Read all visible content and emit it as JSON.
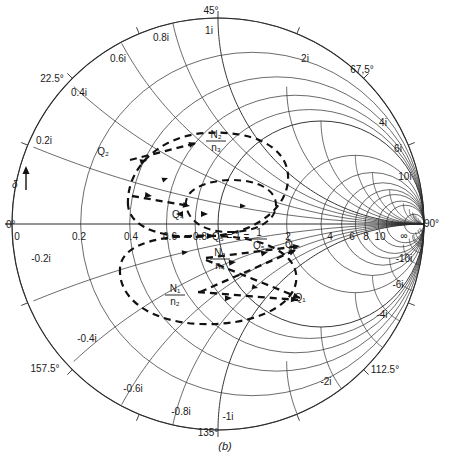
{
  "figure": {
    "caption": "(b)",
    "type": "smith-chart",
    "delta_marker": "δ"
  },
  "chart_data": {
    "type": "smith-chart",
    "title": "",
    "subtitle": "",
    "xlabel": "",
    "ylabel": "",
    "grid": true,
    "legend_position": "none",
    "center": [
      218,
      224
    ],
    "radius": 206,
    "angle_labels": [
      {
        "text": "0°",
        "deg": 0,
        "x": 6,
        "y": 228
      },
      {
        "text": "22.5°",
        "deg": 22.5,
        "x": 52,
        "y": 82
      },
      {
        "text": "45°",
        "deg": 45,
        "x": 211,
        "y": 14
      },
      {
        "text": "67,5°",
        "deg": 67.5,
        "x": 362,
        "y": 73
      },
      {
        "text": "90°",
        "deg": 90,
        "x": 424,
        "y": 227
      },
      {
        "text": "112.5°",
        "deg": 112.5,
        "x": 385,
        "y": 373
      },
      {
        "text": "135°",
        "deg": 135,
        "x": 208,
        "y": 436
      },
      {
        "text": "157.5°",
        "deg": 157.5,
        "x": 45,
        "y": 372
      }
    ],
    "resistance_labels": [
      {
        "text": "0",
        "value": 0,
        "x": 17,
        "y": 240
      },
      {
        "text": "0.2",
        "value": 0.2,
        "x": 79,
        "y": 240
      },
      {
        "text": "0.4",
        "value": 0.4,
        "x": 131,
        "y": 240
      },
      {
        "text": "0.6",
        "value": 0.6,
        "x": 170,
        "y": 240
      },
      {
        "text": "0.8",
        "value": 0.8,
        "x": 200,
        "y": 240
      },
      {
        "text": "2",
        "value": 2,
        "x": 288,
        "y": 240
      },
      {
        "text": "4",
        "value": 4,
        "x": 330,
        "y": 240
      },
      {
        "text": "6",
        "value": 6,
        "x": 352,
        "y": 240
      },
      {
        "text": "8",
        "value": 8,
        "x": 366,
        "y": 240
      },
      {
        "text": "10",
        "value": 10,
        "x": 380,
        "y": 240
      },
      {
        "text": "∞",
        "value": null,
        "x": 404,
        "y": 239
      }
    ],
    "reactance_labels_positive": [
      {
        "text": "0.2i",
        "value": 0.2,
        "x": 44,
        "y": 144
      },
      {
        "text": "0.4i",
        "value": 0.4,
        "x": 79,
        "y": 96
      },
      {
        "text": "0.6i",
        "value": 0.6,
        "x": 118,
        "y": 62
      },
      {
        "text": "0.8i",
        "value": 0.8,
        "x": 161,
        "y": 41
      },
      {
        "text": "1i",
        "value": 1,
        "x": 209,
        "y": 34
      },
      {
        "text": "2i",
        "value": 2,
        "x": 305,
        "y": 62
      },
      {
        "text": "4i",
        "value": 4,
        "x": 383,
        "y": 126
      },
      {
        "text": "6i",
        "value": 6,
        "x": 398,
        "y": 152
      },
      {
        "text": "10i",
        "value": 10,
        "x": 405,
        "y": 180
      }
    ],
    "reactance_labels_negative": [
      {
        "text": "-0.2i",
        "value": -0.2,
        "x": 41,
        "y": 262
      },
      {
        "text": "-0.4i",
        "value": -0.4,
        "x": 87,
        "y": 342
      },
      {
        "text": "-0.6i",
        "value": -0.6,
        "x": 133,
        "y": 392
      },
      {
        "text": "-0.8i",
        "value": -0.8,
        "x": 181,
        "y": 415
      },
      {
        "text": "-1i",
        "value": -1,
        "x": 228,
        "y": 420
      },
      {
        "text": "-2i",
        "value": -2,
        "x": 326,
        "y": 385
      },
      {
        "text": "-4i",
        "value": -4,
        "x": 382,
        "y": 318
      },
      {
        "text": "-6i",
        "value": -6,
        "x": 398,
        "y": 288
      },
      {
        "text": "-10i",
        "value": -10,
        "x": 404,
        "y": 262
      }
    ],
    "annotations": [
      {
        "name": "Q2",
        "text": "Q₂",
        "x": 103,
        "y": 155
      },
      {
        "name": "Q4",
        "text": "Q₄",
        "x": 178,
        "y": 218
      },
      {
        "name": "Q5",
        "text": "Q₅ = 1 = 1/Q₅",
        "x": 212,
        "y": 231
      },
      {
        "name": "Q3",
        "text": "Q₃",
        "x": 291,
        "y": 248
      },
      {
        "name": "Q1",
        "text": "Q₁",
        "x": 300,
        "y": 301
      },
      {
        "name": "N2n3",
        "text": "N₂/n₃",
        "x": 216,
        "y": 140
      },
      {
        "name": "N3n4",
        "text": "N₃/n₄",
        "x": 220,
        "y": 258
      },
      {
        "name": "N1n2",
        "text": "N₁/n₂",
        "x": 175,
        "y": 294
      }
    ],
    "resistance_circles": [
      0,
      0.2,
      0.4,
      0.6,
      0.8,
      1,
      2,
      3,
      4,
      5,
      6,
      8,
      10,
      20
    ],
    "reactance_arcs": [
      0.2,
      0.4,
      0.6,
      0.8,
      1,
      1.5,
      2,
      3,
      4,
      6,
      10,
      20
    ],
    "radial_angles_deg": [
      0,
      22.5,
      45,
      67.5,
      90,
      112.5,
      135,
      157.5
    ],
    "dashed_trajectories": [
      {
        "name": "outer-loop",
        "note": "large dashed closed loop through Q₂ region"
      },
      {
        "name": "inner-loop",
        "note": "small dashed loop near Q₄/Q₅"
      },
      {
        "name": "transfer-arrows",
        "note": "dashed arrowed paths toward Q₁ and Q₃"
      }
    ]
  },
  "colors": {
    "ink": "#1a1a1a",
    "grid": "#3a3a3a",
    "background": "#ffffff"
  }
}
